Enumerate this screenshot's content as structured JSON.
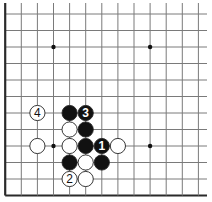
{
  "diagram": {
    "type": "go-board-fragment",
    "corner": "bottom-left",
    "columns_visible": 13,
    "rows_visible": 12,
    "colors": {
      "background": "#ffffff",
      "line": "#7a7a7a",
      "edge": "#2a2a2a",
      "black_stone": "#111111",
      "white_stone": "#ffffff",
      "stone_outline": "#222222"
    },
    "star_points": [
      {
        "col": 3,
        "row": 2
      },
      {
        "col": 9,
        "row": 2
      },
      {
        "col": 3,
        "row": 8
      },
      {
        "col": 9,
        "row": 8
      }
    ],
    "stones": [
      {
        "color": "white",
        "col": 2,
        "row": 6,
        "label": "4"
      },
      {
        "color": "black",
        "col": 4,
        "row": 6,
        "label": ""
      },
      {
        "color": "black",
        "col": 5,
        "row": 6,
        "label": "3"
      },
      {
        "color": "white",
        "col": 4,
        "row": 7,
        "label": ""
      },
      {
        "color": "black",
        "col": 5,
        "row": 7,
        "label": ""
      },
      {
        "color": "white",
        "col": 2,
        "row": 8,
        "label": ""
      },
      {
        "color": "white",
        "col": 4,
        "row": 8,
        "label": ""
      },
      {
        "color": "black",
        "col": 5,
        "row": 8,
        "label": ""
      },
      {
        "color": "black",
        "col": 6,
        "row": 8,
        "label": "1"
      },
      {
        "color": "white",
        "col": 7,
        "row": 8,
        "label": ""
      },
      {
        "color": "black",
        "col": 4,
        "row": 9,
        "label": ""
      },
      {
        "color": "white",
        "col": 5,
        "row": 9,
        "label": ""
      },
      {
        "color": "black",
        "col": 6,
        "row": 9,
        "label": ""
      },
      {
        "color": "white",
        "col": 4,
        "row": 10,
        "label": "2"
      },
      {
        "color": "white",
        "col": 5,
        "row": 10,
        "label": ""
      }
    ]
  }
}
